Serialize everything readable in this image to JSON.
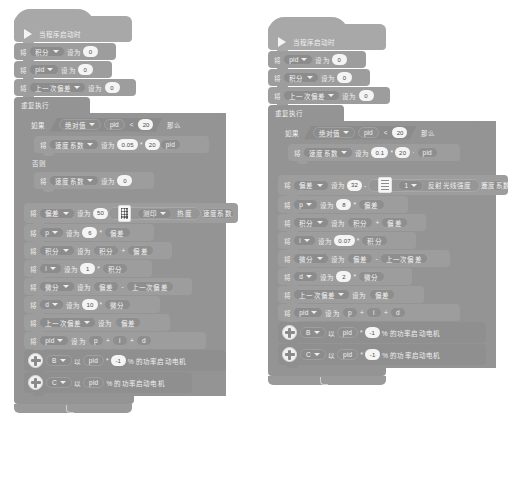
{
  "meta": {
    "app": "block-based visual programming editor (Chinese)",
    "canvas_bg": "#ffffff",
    "palette": {
      "event": "#a8a8a8",
      "variable": "#9d9d9d",
      "control": "#949494",
      "motor": "#8f8f8f",
      "operator": "#969696"
    }
  },
  "words": {
    "set": "将",
    "set_to": "设为",
    "if": "如果",
    "then": "那么",
    "else": "否则",
    "repeat_forever": "重复执行",
    "abs": "绝对值",
    "percent_power_start_motor": "% 的功率启动电机",
    "reflect_light_intensity": "反射光线强度",
    "speed_coefficient": "速度系数",
    "deviation": "偏差",
    "last_deviation": "上一次偏差",
    "integral": "积分",
    "derivative": "微分",
    "pid": "pid",
    "print": "测印",
    "print_arg": "热度",
    "when_program_starts": "当程序启动时"
  },
  "left_stack": {
    "hat": {
      "icon": "play-icon",
      "label": "当程序启动时"
    },
    "init": [
      {
        "set": "将",
        "var": "积分",
        "to": "设为",
        "value": "0"
      },
      {
        "set": "将",
        "var": "pid",
        "to": "设为",
        "value": "0"
      },
      {
        "set": "将",
        "var": "上一次偏差",
        "to": "设为",
        "value": "0"
      }
    ],
    "forever_label": "重复执行",
    "if_block": {
      "if_label": "如果",
      "then_label": "那么",
      "else_label": "否则",
      "condition": {
        "func": "绝对值",
        "arg": "pid",
        "op": "<",
        "right": "20"
      },
      "then_body": [
        {
          "set": "将",
          "var": "速度系数",
          "to": "设为",
          "left": "0.05",
          "op": "*",
          "mid": "20",
          "right": "pid"
        }
      ],
      "else_body": [
        {
          "set": "将",
          "var": "速度系数",
          "to": "设为",
          "value": "0"
        }
      ]
    },
    "body": [
      {
        "set": "将",
        "var": "偏差",
        "to": "设为",
        "value": "50",
        "icon": "keypad-icon",
        "dropdown": "测印",
        "arg": "热度",
        "tail": "速度系数"
      },
      {
        "set": "将",
        "var": "p",
        "to": "设为",
        "value": "6",
        "op": "*",
        "right": "偏差"
      },
      {
        "set": "将",
        "var": "积分",
        "to": "设为",
        "left": "积分",
        "op": "+",
        "right": "偏差"
      },
      {
        "set": "将",
        "var": "i",
        "to": "设为",
        "value": "1",
        "op": "*",
        "right": "积分"
      },
      {
        "set": "将",
        "var": "微分",
        "to": "设为",
        "left": "偏差",
        "op": "-",
        "right": "上一次偏差"
      },
      {
        "set": "将",
        "var": "d",
        "to": "设为",
        "value": "10",
        "op": "*",
        "right": "微分"
      },
      {
        "set": "将",
        "var": "上一次偏差",
        "to": "设为",
        "right": "偏差"
      },
      {
        "set": "将",
        "var": "pid",
        "to": "设为",
        "a": "p",
        "op1": "+",
        "b": "i",
        "op2": "+",
        "c": "d"
      }
    ],
    "motors": [
      {
        "port": "B",
        "with": "以",
        "value": "pid",
        "op": "*",
        "factor": "-1",
        "suffix": "% 的功率启动电机"
      },
      {
        "port": "C",
        "with": "以",
        "value": "pid",
        "suffix": "% 的功率启动电机"
      }
    ]
  },
  "right_stack": {
    "hat": {
      "icon": "play-icon",
      "label": "当程序启动时"
    },
    "init": [
      {
        "set": "将",
        "var": "pid",
        "to": "设为",
        "value": "0"
      },
      {
        "set": "将",
        "var": "积分",
        "to": "设为",
        "value": "0"
      },
      {
        "set": "将",
        "var": "上一次偏差",
        "to": "设为",
        "value": "0"
      }
    ],
    "forever_label": "重复执行",
    "if_block": {
      "if_label": "如果",
      "then_label": "那么",
      "condition": {
        "func": "绝对值",
        "arg": "pid",
        "op": "<",
        "right": "20"
      },
      "then_body": [
        {
          "set": "将",
          "var": "速度系数",
          "to": "设为",
          "left": "0.1",
          "op": "*",
          "mid": "20",
          "right": "pid"
        }
      ]
    },
    "body": [
      {
        "set": "将",
        "var": "偏差",
        "to": "设为",
        "value": "32",
        "op": "-",
        "icon": "color-sensor-icon",
        "port": "1",
        "sensor": "反射光线强度",
        "op2": "*",
        "tail": "速度系数"
      },
      {
        "set": "将",
        "var": "p",
        "to": "设为",
        "value": "8",
        "op": "*",
        "right": "偏差"
      },
      {
        "set": "将",
        "var": "积分",
        "to": "设为",
        "left": "积分",
        "op": "+",
        "right": "偏差"
      },
      {
        "set": "将",
        "var": "i",
        "to": "设为",
        "value": "0.07",
        "op": "*",
        "right": "积分"
      },
      {
        "set": "将",
        "var": "微分",
        "to": "设为",
        "left": "偏差",
        "op": "-",
        "right": "上一次偏差"
      },
      {
        "set": "将",
        "var": "d",
        "to": "设为",
        "value": "2",
        "op": "*",
        "right": "微分"
      },
      {
        "set": "将",
        "var": "上一次偏差",
        "to": "设为",
        "right": "偏差"
      },
      {
        "set": "将",
        "var": "pid",
        "to": "设为",
        "a": "p",
        "op1": "+",
        "b": "i",
        "op2": "+",
        "c": "d"
      }
    ],
    "motors": [
      {
        "port": "B",
        "with": "以",
        "value": "pid",
        "op": "*",
        "factor": "-1",
        "suffix": "% 的功率启动电机"
      },
      {
        "port": "C",
        "with": "以",
        "value": "pid",
        "op": "*",
        "factor": "-1",
        "suffix": "% 的功率启动电机"
      }
    ]
  }
}
